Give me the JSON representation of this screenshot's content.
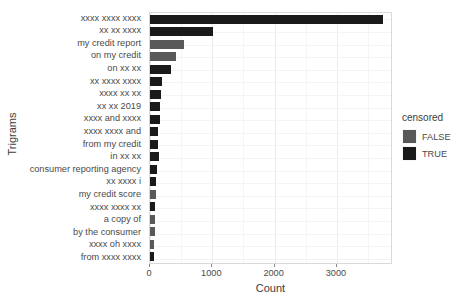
{
  "chart_data": {
    "type": "bar",
    "orientation": "horizontal",
    "title": "",
    "xlabel": "Count",
    "ylabel": "Trigrams",
    "xlim": [
      0,
      3900
    ],
    "xticks": [
      0,
      1000,
      2000,
      3000
    ],
    "xticklabels": [
      "0",
      "1000",
      "2000",
      "3000"
    ],
    "grid": true,
    "legend": {
      "title": "censored",
      "position": "right",
      "entries": [
        {
          "label": "FALSE",
          "color": "#595959"
        },
        {
          "label": "TRUE",
          "color": "#1a1a1a"
        }
      ]
    },
    "categories": [
      "xxxx xxxx xxxx",
      "xx xx xxxx",
      "my credit report",
      "on my credit",
      "on xx xx",
      "xx xxxx xxxx",
      "xxxx xx xx",
      "xx xx 2019",
      "xxxx and xxxx",
      "xxxx xxxx and",
      "from my credit",
      "in xx xx",
      "consumer reporting agency",
      "xx xxxx i",
      "my credit score",
      "xxxx xxxx xx",
      "a copy of",
      "by the consumer",
      "xxxx oh xxxx",
      "from xxxx xxxx"
    ],
    "values": [
      3740,
      1010,
      545,
      415,
      330,
      185,
      170,
      160,
      165,
      130,
      125,
      140,
      120,
      95,
      90,
      80,
      75,
      75,
      60,
      70
    ],
    "censored": [
      true,
      true,
      false,
      false,
      true,
      true,
      true,
      true,
      true,
      true,
      true,
      true,
      true,
      true,
      false,
      true,
      false,
      false,
      false,
      true
    ],
    "series": [
      {
        "name": "TRUE",
        "color": "#1a1a1a",
        "points": [
          {
            "category": "xxxx xxxx xxxx",
            "value": 3740
          },
          {
            "category": "xx xx xxxx",
            "value": 1010
          },
          {
            "category": "on xx xx",
            "value": 330
          },
          {
            "category": "xx xxxx xxxx",
            "value": 185
          },
          {
            "category": "xxxx xx xx",
            "value": 170
          },
          {
            "category": "xx xx 2019",
            "value": 160
          },
          {
            "category": "xxxx and xxxx",
            "value": 165
          },
          {
            "category": "xxxx xxxx and",
            "value": 130
          },
          {
            "category": "from my credit",
            "value": 125
          },
          {
            "category": "in xx xx",
            "value": 140
          },
          {
            "category": "consumer reporting agency",
            "value": 120
          },
          {
            "category": "xx xxxx i",
            "value": 95
          },
          {
            "category": "xxxx xxxx xx",
            "value": 80
          },
          {
            "category": "from xxxx xxxx",
            "value": 70
          }
        ]
      },
      {
        "name": "FALSE",
        "color": "#595959",
        "points": [
          {
            "category": "my credit report",
            "value": 545
          },
          {
            "category": "on my credit",
            "value": 415
          },
          {
            "category": "my credit score",
            "value": 90
          },
          {
            "category": "a copy of",
            "value": 75
          },
          {
            "category": "by the consumer",
            "value": 75
          },
          {
            "category": "xxxx oh xxxx",
            "value": 60
          }
        ]
      }
    ]
  },
  "axis": {
    "x_title": "Count",
    "y_title": "Trigrams"
  }
}
